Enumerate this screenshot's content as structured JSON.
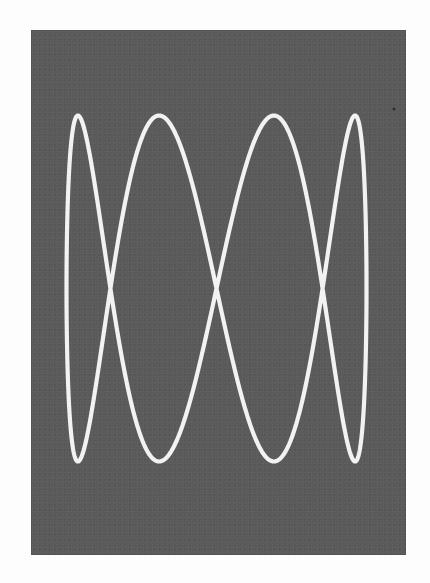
{
  "figure": {
    "description": "Lissajous figure on dark oscilloscope-style background",
    "panel_color": "#5b5b5b",
    "curve_color": "#f2f2f2",
    "page_color": "#fdfdfd"
  },
  "chart_data": {
    "type": "line",
    "title": "",
    "xlabel": "",
    "ylabel": "",
    "grid": false,
    "legend": null,
    "parametric": {
      "x": "sin(t)",
      "y": "sin(4t)",
      "frequency_ratio": "1:4",
      "t_range": [
        0,
        6.283185307
      ],
      "samples": 720
    },
    "pixel_mapping": {
      "x_center": 216.5,
      "x_amplitude": 150,
      "y_center": 288.5,
      "y_amplitude": 173
    },
    "xlim": [
      -1,
      1
    ],
    "ylim": [
      -1,
      1
    ],
    "features": {
      "top_peaks_x": [
        -0.924,
        -0.383,
        0.383,
        0.924
      ],
      "bottom_troughs_x": [
        -0.924,
        -0.383,
        0.383,
        0.924
      ],
      "self_crossings": [
        {
          "x": -0.707,
          "y": 0
        },
        {
          "x": 0,
          "y": 0
        },
        {
          "x": 0.707,
          "y": 0
        }
      ],
      "top_peak_count": 4,
      "bottom_trough_count": 4
    }
  }
}
